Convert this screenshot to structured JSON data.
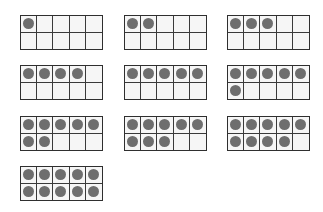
{
  "ten_frames": {
    "columns": 5,
    "rows": 2,
    "dot_color": "#6e6e6e",
    "border_color": "#2f2f2f",
    "cell_fill": "#f6f6f6",
    "frames": [
      {
        "count": 1,
        "x": 20,
        "y": 15
      },
      {
        "count": 2,
        "x": 124,
        "y": 15
      },
      {
        "count": 3,
        "x": 227,
        "y": 15
      },
      {
        "count": 4,
        "x": 20,
        "y": 65
      },
      {
        "count": 5,
        "x": 124,
        "y": 65
      },
      {
        "count": 6,
        "x": 227,
        "y": 65
      },
      {
        "count": 7,
        "x": 20,
        "y": 116
      },
      {
        "count": 8,
        "x": 124,
        "y": 116
      },
      {
        "count": 9,
        "x": 227,
        "y": 116
      },
      {
        "count": 10,
        "x": 20,
        "y": 166
      }
    ]
  }
}
